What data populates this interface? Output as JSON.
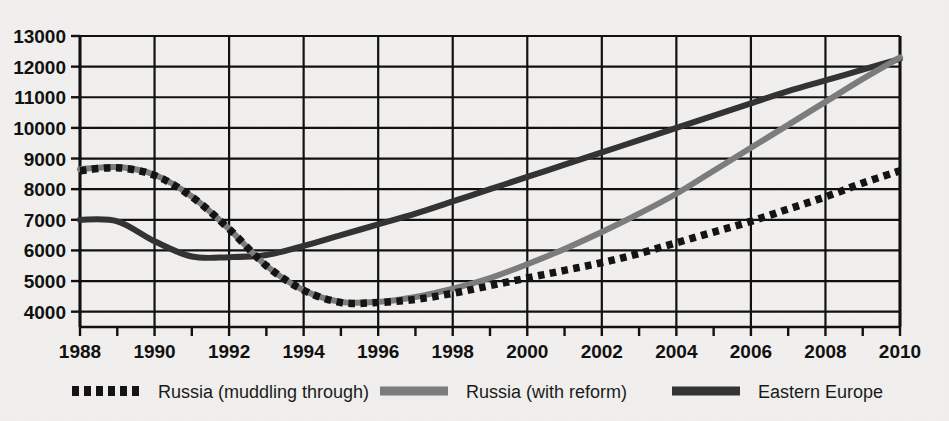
{
  "chart_data": {
    "type": "line",
    "title": "",
    "subtitle": "",
    "xlabel": "",
    "ylabel": "",
    "xlim": [
      1988,
      2010
    ],
    "ylim": [
      3500,
      13000
    ],
    "yticks": [
      4000,
      5000,
      6000,
      7000,
      8000,
      9000,
      10000,
      11000,
      12000,
      13000
    ],
    "ytick_labels": [
      "4000",
      "5000",
      "6000",
      "7000",
      "8000",
      "9000",
      "10000",
      "11000",
      "12000",
      "13000"
    ],
    "xticks": [
      1988,
      1989,
      1990,
      1991,
      1992,
      1993,
      1994,
      1995,
      1996,
      1997,
      1998,
      1999,
      2000,
      2001,
      2002,
      2003,
      2004,
      2005,
      2006,
      2007,
      2008,
      2009,
      2010
    ],
    "xtick_labels": [
      "1988",
      "",
      "1990",
      "",
      "1992",
      "",
      "1994",
      "",
      "1996",
      "",
      "1998",
      "",
      "2000",
      "",
      "2002",
      "",
      "2004",
      "",
      "2006",
      "",
      "2008",
      "",
      "2010"
    ],
    "xlabels_shown": [
      "1988",
      "1990",
      "1992",
      "1994",
      "1996",
      "1998",
      "2000",
      "2002",
      "2004",
      "2006",
      "2008",
      "2010"
    ],
    "grid": true,
    "grid_x_every": 2,
    "grid_y_every": 1000,
    "legend_position": "bottom",
    "x": [
      1988,
      1989,
      1990,
      1991,
      1992,
      1993,
      1994,
      1995,
      1996,
      1997,
      1998,
      1999,
      2000,
      2001,
      2002,
      2003,
      2004,
      2005,
      2006,
      2007,
      2008,
      2009,
      2010
    ],
    "series": [
      {
        "name": "Russia (muddling through)",
        "style": "dotted",
        "color": "#141414",
        "values": [
          8600,
          8700,
          8450,
          7750,
          6700,
          5500,
          4700,
          4300,
          4300,
          4400,
          4600,
          4850,
          5100,
          5350,
          5600,
          5900,
          6250,
          6600,
          6950,
          7350,
          7750,
          8200,
          8600
        ]
      },
      {
        "name": "Russia (with reform)",
        "style": "solid",
        "color": "#7d7d7d",
        "values": [
          8650,
          8720,
          8470,
          7760,
          6700,
          5500,
          4700,
          4320,
          4320,
          4480,
          4750,
          5100,
          5550,
          6050,
          6600,
          7200,
          7850,
          8600,
          9350,
          10100,
          10850,
          11600,
          12300
        ]
      },
      {
        "name": "Eastern Europe",
        "style": "solid",
        "color": "#333333",
        "values": [
          7000,
          6950,
          6300,
          5800,
          5780,
          5850,
          6150,
          6500,
          6850,
          7200,
          7600,
          8000,
          8400,
          8800,
          9200,
          9600,
          10000,
          10400,
          10800,
          11200,
          11550,
          11900,
          12250
        ]
      }
    ]
  },
  "legend": {
    "items": [
      {
        "label": "Russia (muddling through)",
        "swatch": "dotted",
        "color": "#141414"
      },
      {
        "label": "Russia (with reform)",
        "swatch": "solid",
        "color": "#7d7d7d"
      },
      {
        "label": "Eastern Europe",
        "swatch": "solid",
        "color": "#333333"
      }
    ]
  },
  "axes": {
    "y_axis_name": "y-axis",
    "x_axis_name": "x-axis"
  }
}
